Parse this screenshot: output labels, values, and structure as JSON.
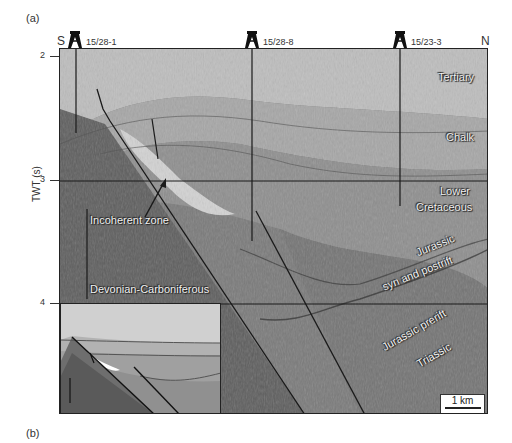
{
  "figure": {
    "panel_a_label": "(a)",
    "panel_b_label": "(b)",
    "direction_left": "S",
    "direction_right": "N",
    "y_axis_label": "TWT (s)",
    "y_ticks": [
      "2",
      "3",
      "4"
    ],
    "wells": [
      {
        "name": "15/28-1",
        "icon": "well-derrick-icon"
      },
      {
        "name": "15/28-8",
        "icon": "well-derrick-icon"
      },
      {
        "name": "15/23-3",
        "icon": "well-derrick-icon"
      }
    ],
    "units": {
      "tertiary": "Tertiary",
      "chalk": "Chalk",
      "lower_cretaceous_1": "Lower",
      "lower_cretaceous_2": "Cretaceous",
      "jurassic_syn_1": "Jurassic",
      "jurassic_syn_2": "syn and postrift",
      "jurassic_prerift": "Jurassic prerift",
      "triassic": "Triassic",
      "devonian": "Devonian-Carboniferous",
      "incoherent": "Incoherent zone"
    },
    "scale_bar": "1 km",
    "colors": {
      "tertiary": "#bdbdbd",
      "chalk": "#a4a4a4",
      "cretaceous": "#8f8f8f",
      "jurassic": "#7d7d7d",
      "basement": "#5e5e5e",
      "incoherent": "#d2d2d2",
      "lines": "#1a1a1a"
    }
  }
}
